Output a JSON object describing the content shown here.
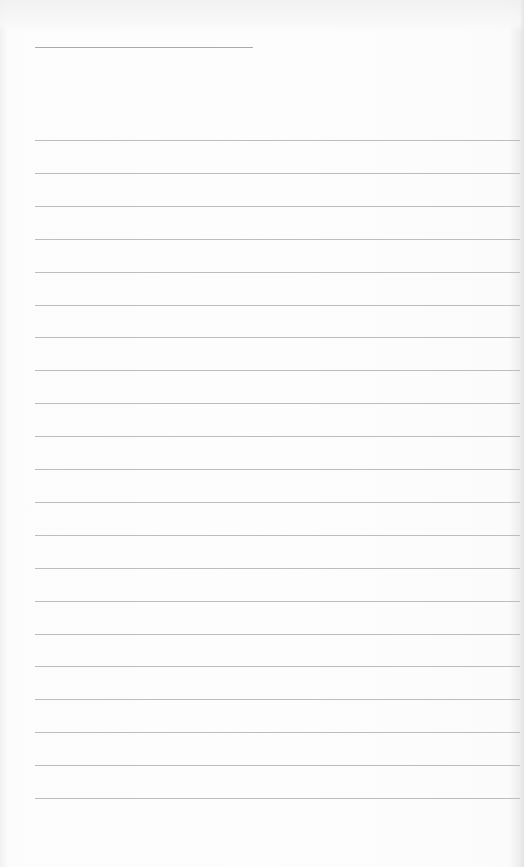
{
  "document": {
    "type": "blank lined writing sheet",
    "header_text": "",
    "name_line": {
      "x": 35,
      "y": 47,
      "width": 218
    },
    "ruled_lines": {
      "count": 21,
      "start_y": 140,
      "spacing": 32.9,
      "x_start": 35,
      "x_end": 520,
      "color": "#bdbdbd"
    },
    "colors": {
      "paper": "#fcfcfc",
      "line": "#bdbdbd",
      "name_line": "#a9a9a9"
    }
  }
}
